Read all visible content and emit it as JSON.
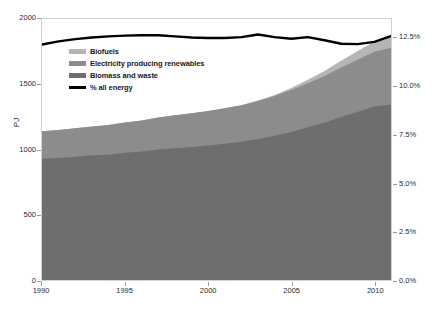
{
  "chart_data": {
    "type": "area",
    "title": "",
    "xlabel": "",
    "ylabel": "PJ",
    "y2label": "",
    "grid": false,
    "legend_position": "inside-top-left",
    "xlim": [
      1990,
      2011
    ],
    "ylim": [
      0,
      2000
    ],
    "y2lim": [
      0,
      0.135
    ],
    "x": [
      1990,
      1991,
      1992,
      1993,
      1994,
      1995,
      1996,
      1997,
      1998,
      1999,
      2000,
      2001,
      2002,
      2003,
      2004,
      2005,
      2006,
      2007,
      2008,
      2009,
      2010,
      2011
    ],
    "xticks": [
      "1990",
      "1995",
      "2000",
      "2005",
      "2010"
    ],
    "xtick_values": [
      1990,
      1995,
      2000,
      2005,
      2010
    ],
    "yticks": [
      "0",
      "500",
      "1000",
      "1500",
      "2000"
    ],
    "ytick_values": [
      0,
      500,
      1000,
      1500,
      2000
    ],
    "y2ticks": [
      "0.0%",
      "2.5%",
      "5.0%",
      "7.5%",
      "10.0%",
      "12.5%"
    ],
    "y2tick_values": [
      0,
      2.5,
      5,
      7.5,
      10,
      12.5
    ],
    "stacked": true,
    "series": [
      {
        "name": "Biomass and waste",
        "color": "#6e6e6e",
        "axis": "left",
        "values": [
          930,
          935,
          945,
          955,
          960,
          975,
          985,
          1000,
          1010,
          1020,
          1030,
          1045,
          1060,
          1080,
          1105,
          1135,
          1170,
          1205,
          1250,
          1290,
          1330,
          1345
        ]
      },
      {
        "name": "Electricity producing renewables",
        "color": "#8c8c8c",
        "axis": "left",
        "values": [
          210,
          215,
          218,
          222,
          228,
          232,
          238,
          245,
          252,
          258,
          265,
          272,
          280,
          292,
          305,
          320,
          338,
          358,
          378,
          398,
          420,
          435
        ]
      },
      {
        "name": "Biofuels",
        "color": "#b5b5b5",
        "axis": "left",
        "values": [
          0,
          0,
          0,
          0,
          0,
          0,
          0,
          0,
          0,
          0,
          0,
          0,
          0,
          3,
          8,
          16,
          26,
          38,
          52,
          66,
          78,
          88
        ]
      }
    ],
    "line_series": {
      "name": "% all energy",
      "color": "#000000",
      "axis": "right",
      "values": [
        12.18,
        12.34,
        12.46,
        12.54,
        12.6,
        12.64,
        12.66,
        12.66,
        12.6,
        12.54,
        12.52,
        12.52,
        12.56,
        12.7,
        12.56,
        12.48,
        12.56,
        12.4,
        12.22,
        12.2,
        12.32,
        12.62
      ]
    },
    "legend_entries": [
      {
        "label": "Biofuels",
        "swatch": "#b5b5b5",
        "type": "area"
      },
      {
        "label": "Electricity producing renewables",
        "swatch": "#8c8c8c",
        "type": "area"
      },
      {
        "label": "Biomass and waste",
        "swatch": "#6e6e6e",
        "type": "area"
      },
      {
        "label": "% all energy",
        "swatch": "#000000",
        "type": "line"
      }
    ]
  }
}
